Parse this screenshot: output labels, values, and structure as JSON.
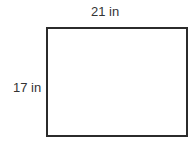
{
  "diagram": {
    "shape": "rectangle",
    "width_label": "21 in",
    "height_label": "17 in",
    "stroke_color": "#2b2b2b",
    "fill_color": "#ffffff"
  }
}
